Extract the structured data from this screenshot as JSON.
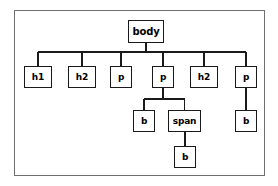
{
  "diagram": {
    "type": "tree",
    "frame": {
      "border_color": "#6f6f6f",
      "background": "#ffffff"
    },
    "node_style": {
      "border_color": "#1a1a1a",
      "fill": "#ffffff",
      "text_color": "#000000"
    },
    "edge_style": {
      "color": "#1a1a1a",
      "width": 1.6
    },
    "nodes": [
      {
        "id": "body",
        "label": "body",
        "level": 0,
        "parent": null,
        "x": 128,
        "y": 20,
        "w": 36,
        "h": 23,
        "font_size": 10
      },
      {
        "id": "h1_1",
        "label": "h1",
        "level": 1,
        "parent": "body",
        "x": 24,
        "y": 66,
        "w": 28,
        "h": 22,
        "font_size": 9
      },
      {
        "id": "h2_1",
        "label": "h2",
        "level": 1,
        "parent": "body",
        "x": 68,
        "y": 66,
        "w": 28,
        "h": 22,
        "font_size": 9
      },
      {
        "id": "p_1",
        "label": "p",
        "level": 1,
        "parent": "body",
        "x": 110,
        "y": 66,
        "w": 22,
        "h": 22,
        "font_size": 9
      },
      {
        "id": "p_2",
        "label": "p",
        "level": 1,
        "parent": "body",
        "x": 152,
        "y": 66,
        "w": 22,
        "h": 22,
        "font_size": 9
      },
      {
        "id": "h2_2",
        "label": "h2",
        "level": 1,
        "parent": "body",
        "x": 190,
        "y": 66,
        "w": 28,
        "h": 22,
        "font_size": 9
      },
      {
        "id": "p_3",
        "label": "p",
        "level": 1,
        "parent": "body",
        "x": 235,
        "y": 66,
        "w": 22,
        "h": 22,
        "font_size": 9
      },
      {
        "id": "b_1",
        "label": "b",
        "level": 2,
        "parent": "p_2",
        "x": 133,
        "y": 110,
        "w": 22,
        "h": 22,
        "font_size": 9
      },
      {
        "id": "span_1",
        "label": "span",
        "level": 2,
        "parent": "p_2",
        "x": 168,
        "y": 110,
        "w": 33,
        "h": 22,
        "font_size": 9
      },
      {
        "id": "b_2",
        "label": "b",
        "level": 2,
        "parent": "p_3",
        "x": 235,
        "y": 110,
        "w": 22,
        "h": 22,
        "font_size": 9
      },
      {
        "id": "b_3",
        "label": "b",
        "level": 3,
        "parent": "span_1",
        "x": 174,
        "y": 146,
        "w": 22,
        "h": 22,
        "font_size": 9
      }
    ],
    "edges": [
      {
        "from": "body",
        "to": "h1_1",
        "bus_y": 52
      },
      {
        "from": "body",
        "to": "h2_1",
        "bus_y": 52
      },
      {
        "from": "body",
        "to": "p_1",
        "bus_y": 52
      },
      {
        "from": "body",
        "to": "p_2",
        "bus_y": 52
      },
      {
        "from": "body",
        "to": "h2_2",
        "bus_y": 52
      },
      {
        "from": "body",
        "to": "p_3",
        "bus_y": 52
      },
      {
        "from": "p_2",
        "to": "b_1",
        "bus_y": 99
      },
      {
        "from": "p_2",
        "to": "span_1",
        "bus_y": 99
      },
      {
        "from": "p_3",
        "to": "b_2",
        "bus_y": null
      },
      {
        "from": "span_1",
        "to": "b_3",
        "bus_y": null
      }
    ]
  }
}
